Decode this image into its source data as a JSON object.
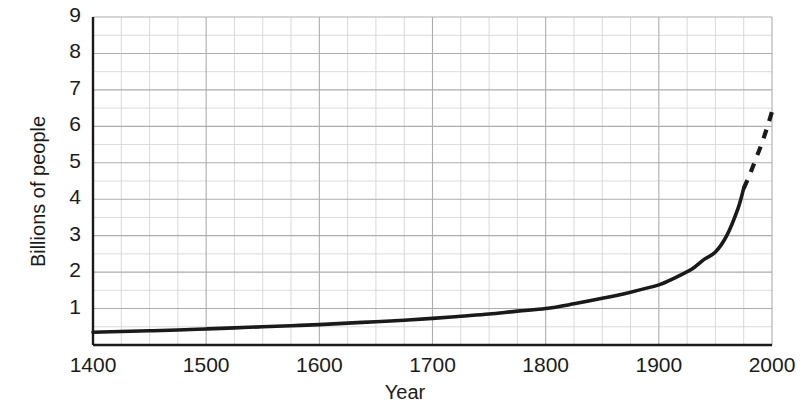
{
  "chart_data": {
    "type": "line",
    "title": "",
    "xlabel": "Year",
    "ylabel": "Billions of people",
    "xlim": [
      1400,
      2000
    ],
    "ylim": [
      0,
      9
    ],
    "x_ticks": [
      1400,
      1500,
      1600,
      1700,
      1800,
      1900,
      2000
    ],
    "y_ticks": [
      1,
      2,
      3,
      4,
      5,
      6,
      7,
      8,
      9
    ],
    "x_minor_step": 25,
    "y_minor_step": 0.5,
    "grid": true,
    "legend": null,
    "line_color": "#1a1a1a",
    "grid_color": "#c8c8c8",
    "axis_color": "#1a1a1a",
    "series": [
      {
        "name": "World population",
        "style": "solid",
        "x": [
          1400,
          1425,
          1450,
          1475,
          1500,
          1525,
          1550,
          1575,
          1600,
          1625,
          1650,
          1675,
          1700,
          1725,
          1750,
          1775,
          1800,
          1825,
          1850,
          1875,
          1900,
          1910,
          1920,
          1930,
          1940,
          1950,
          1960,
          1970,
          1975
        ],
        "values": [
          0.35,
          0.37,
          0.39,
          0.41,
          0.44,
          0.47,
          0.5,
          0.53,
          0.56,
          0.6,
          0.64,
          0.68,
          0.73,
          0.79,
          0.85,
          0.93,
          1.0,
          1.13,
          1.28,
          1.45,
          1.65,
          1.78,
          1.93,
          2.1,
          2.35,
          2.55,
          3.0,
          3.75,
          4.3
        ]
      },
      {
        "name": "Projection",
        "style": "dashed",
        "x": [
          1975,
          1980,
          1985,
          1990,
          1995,
          2000
        ],
        "values": [
          4.3,
          4.65,
          5.05,
          5.45,
          5.9,
          6.4
        ]
      }
    ],
    "annotations": []
  },
  "axes": {
    "y_tick_labels": [
      "9",
      "8",
      "7",
      "6",
      "5",
      "4",
      "3",
      "2",
      "1"
    ],
    "x_tick_labels": [
      "1400",
      "1500",
      "1600",
      "1700",
      "1800",
      "1900",
      "2000"
    ],
    "y_axis_title": "Billions of people",
    "x_axis_title": "Year"
  }
}
